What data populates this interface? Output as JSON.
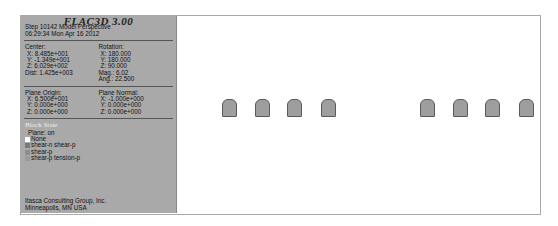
{
  "panel": {
    "title": "FLAC3D 3.00",
    "step_line": "Step 10142  Model Perspective",
    "time_line": "06:29:34 Mon Apr 16 2012",
    "center": {
      "label": "Center:",
      "x": "X: 8.485e+001",
      "y": "Y: -1.349e+001",
      "z": "Z: 6.029e+002",
      "dist": "Dist: 1.425e+003"
    },
    "rotation": {
      "label": "Rotation:",
      "x": "X: 180.000",
      "y": "Y: 180.000",
      "z": "Z:  90.000",
      "mag": "Mag.:      6.02",
      "ang": "Ang.:  22.500"
    },
    "plane_origin": {
      "label": "Plane Origin:",
      "x": "X: 6.500e+001",
      "y": "Y: 0.000e+000",
      "z": "Z: 0.000e+000"
    },
    "plane_normal": {
      "label": "Plane Normal:",
      "x": "X: -1.000e+000",
      "y": "Y: 0.000e+000",
      "z": "Z: 0.000e+000"
    },
    "legend": {
      "title": "Block State",
      "plane": "Plane: on",
      "items": [
        {
          "label": "None",
          "color": "#ffffff"
        },
        {
          "label": "shear-n shear-p",
          "color": "#7a7a7a"
        },
        {
          "label": "shear-p",
          "color": "#8c8c8c"
        },
        {
          "label": "shear-p tension-p",
          "color": "#9a9a9a"
        }
      ]
    },
    "footer": {
      "line1": "Itasca Consulting Group, Inc.",
      "line2": "Minneapolis, MN  USA"
    }
  },
  "viewport": {
    "blocks_x": [
      222,
      255,
      287,
      321,
      420,
      453,
      485,
      519
    ],
    "block_y": 99
  }
}
